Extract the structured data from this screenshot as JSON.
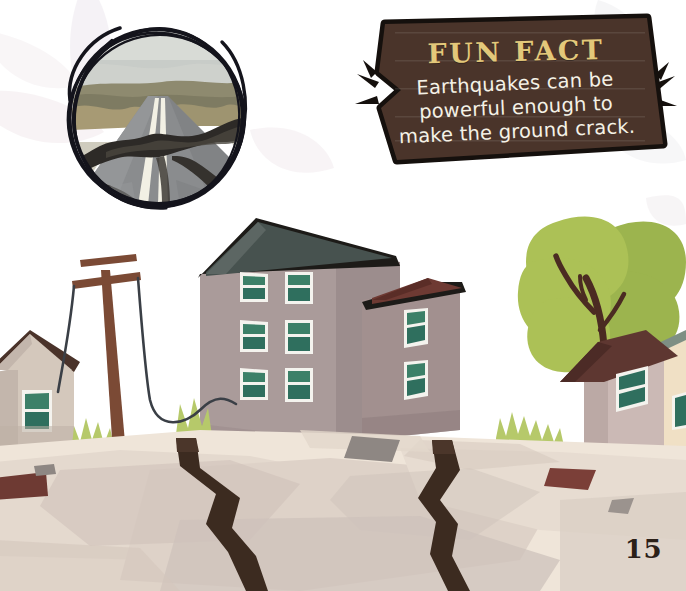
{
  "page": {
    "number": "15",
    "background_color": "#ffffff"
  },
  "fun_fact": {
    "title": "FUN FACT",
    "body": "Earthquakes can be powerful enough to make the ground crack.",
    "body_line_1": "Earthquakes can be",
    "body_line_2": "powerful enough to",
    "body_line_3": "make the ground crack.",
    "banner_fill": "#4a342a",
    "banner_outline": "#15100d",
    "title_color": "#e3c87a",
    "body_color": "#f4f1e6",
    "burst_marks": "speed-lines"
  },
  "photo": {
    "alt": "cracked asphalt road with centre line split by an earthquake fissure",
    "frame_style": "hand-drawn-scribble-circle",
    "frame_color": "#14141c",
    "sky_color": "#c9ccc6",
    "road_color": "#8e9094",
    "crack_color": "#2a2724",
    "line_color": "#f2f0e7",
    "brush_color": "#a89a72"
  },
  "illustration": {
    "description": "cartoon street scene with buildings, leaning utility pole, trees and a large crack splitting the ground",
    "ground": {
      "far_color": "#efe5d9",
      "mid_color": "#ded2c8",
      "near_color": "#cdc2bb",
      "shadow_color": "#c2b6b0",
      "crack_color": "#3c2b20"
    },
    "tall_building": {
      "wall_color": "#a99a99",
      "wall_shade_color": "#9a8b8b",
      "roof_color": "#47524f",
      "window_color": "#2f6f5e",
      "window_frame_color": "#f3f3ee",
      "window_count": 6
    },
    "annex_building": {
      "wall_color": "#a2908f",
      "roof_color": "#6e3a33",
      "window_count": 2
    },
    "left_house": {
      "wall_color": "#d4c8bc",
      "roof_color": "#4a332a",
      "window_count": 1
    },
    "right_house": {
      "wall_color": "#cbb9b5",
      "roof_color": "#5e3731",
      "window_count": 1
    },
    "far_right_building": {
      "wall_color": "#f0e0c5",
      "roof_color": "#7e8f84"
    },
    "utility_pole": {
      "post_color": "#7b4a35",
      "wire_color": "#3a3f46",
      "state": "leaning"
    },
    "trees": {
      "foliage_color": "#a9bf57",
      "foliage_dark_color": "#8faa45",
      "trunk_color": "#4a2b22",
      "count": 2
    },
    "bushes": {
      "color": "#b6c96a"
    },
    "debris": {
      "count": 5,
      "colors": [
        "#8e8783",
        "#6e3a33",
        "#a39b96"
      ]
    }
  }
}
